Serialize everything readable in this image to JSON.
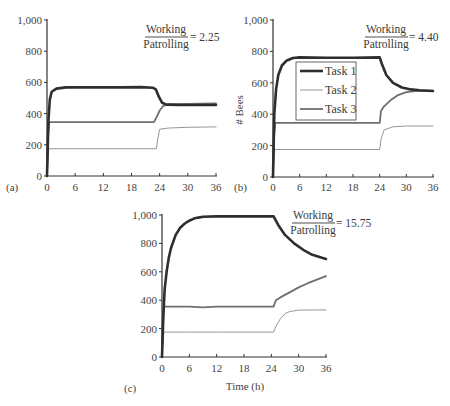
{
  "figure": {
    "panels": [
      {
        "id": "a",
        "label": "(a)",
        "ratio_num": "Working",
        "ratio_den": "Patrolling",
        "ratio_value": "= 2.25"
      },
      {
        "id": "b",
        "label": "(b)",
        "ratio_num": "Working",
        "ratio_den": "Patrolling",
        "ratio_value": "= 4.40"
      },
      {
        "id": "c",
        "label": "(c)",
        "ratio_num": "Working",
        "ratio_den": "Patrolling",
        "ratio_value": "= 15.75"
      }
    ],
    "legend": [
      "Task 1",
      "Task 2",
      "Task 3"
    ],
    "ylabel": "# Bees",
    "xlabel": "Time (h)"
  },
  "colors": {
    "task1": "#2e2e2e",
    "task2": "#8a8a8a",
    "task3": "#6f6f6f",
    "axis": "#333333"
  },
  "chart_data": [
    {
      "type": "line",
      "panel": "(a)",
      "title": "Working/Patrolling = 2.25",
      "xlabel": "",
      "ylabel": "",
      "xlim": [
        0,
        36
      ],
      "ylim": [
        0,
        1000
      ],
      "xticks": [
        0,
        6,
        12,
        18,
        24,
        30,
        36
      ],
      "yticks": [
        0,
        200,
        400,
        600,
        800,
        1000
      ],
      "ytick_labels": [
        "0",
        "200",
        "400",
        "600",
        "800",
        "1,000"
      ],
      "grid": false,
      "series": [
        {
          "name": "Task 1",
          "x": [
            0,
            0.3,
            0.6,
            1,
            2,
            4,
            8,
            12,
            16,
            20,
            22.5,
            23.2,
            23.8,
            24.5,
            25.5,
            28,
            32,
            36
          ],
          "y": [
            0,
            350,
            490,
            540,
            560,
            568,
            568,
            568,
            568,
            570,
            566,
            555,
            510,
            470,
            458,
            455,
            455,
            455
          ]
        },
        {
          "name": "Task 2",
          "x": [
            0,
            0.2,
            0.4,
            6,
            12,
            18,
            23.3,
            23.6,
            24,
            26,
            30,
            36
          ],
          "y": [
            0,
            100,
            175,
            175,
            175,
            175,
            175,
            240,
            300,
            308,
            312,
            315
          ]
        },
        {
          "name": "Task 3",
          "x": [
            0,
            0.2,
            0.5,
            6,
            12,
            18,
            22.8,
            23.4,
            24,
            24.8,
            26,
            30,
            36
          ],
          "y": [
            0,
            250,
            345,
            345,
            345,
            345,
            345,
            380,
            420,
            450,
            460,
            462,
            465
          ]
        }
      ]
    },
    {
      "type": "line",
      "panel": "(b)",
      "title": "Working/Patrolling = 4.40",
      "xlabel": "",
      "ylabel": "# Bees",
      "xlim": [
        0,
        36
      ],
      "ylim": [
        0,
        1000
      ],
      "xticks": [
        0,
        6,
        12,
        18,
        24,
        30,
        36
      ],
      "yticks": [
        0,
        200,
        400,
        600,
        800,
        1000
      ],
      "ytick_labels": [
        "0",
        "200",
        "400",
        "600",
        "800",
        "1,000"
      ],
      "legend_position": "inside-left",
      "grid": false,
      "series": [
        {
          "name": "Task 1",
          "x": [
            0,
            0.3,
            0.7,
            1.2,
            2,
            3,
            4.5,
            6,
            12,
            18,
            24,
            24.5,
            25.5,
            27,
            29,
            31,
            33,
            36
          ],
          "y": [
            0,
            400,
            560,
            650,
            710,
            740,
            758,
            762,
            760,
            760,
            762,
            720,
            650,
            600,
            570,
            558,
            553,
            548
          ]
        },
        {
          "name": "Task 2",
          "x": [
            0,
            0.2,
            0.4,
            6,
            12,
            18,
            24,
            24.3,
            25,
            27,
            30,
            36
          ],
          "y": [
            0,
            100,
            175,
            175,
            175,
            175,
            175,
            240,
            300,
            320,
            325,
            325
          ]
        },
        {
          "name": "Task 3",
          "x": [
            0,
            0.2,
            0.5,
            6,
            12,
            18,
            24,
            24.3,
            25,
            26.5,
            28,
            30,
            32,
            36
          ],
          "y": [
            0,
            250,
            345,
            345,
            345,
            345,
            345,
            420,
            450,
            490,
            520,
            540,
            548,
            550
          ]
        }
      ]
    },
    {
      "type": "line",
      "panel": "(c)",
      "title": "Working/Patrolling = 15.75",
      "xlabel": "Time (h)",
      "ylabel": "",
      "xlim": [
        0,
        36
      ],
      "ylim": [
        0,
        1000
      ],
      "xticks": [
        0,
        6,
        12,
        18,
        24,
        30,
        36
      ],
      "yticks": [
        0,
        200,
        400,
        600,
        800,
        1000
      ],
      "ytick_labels": [
        "0",
        "200",
        "400",
        "600",
        "800",
        "1,000"
      ],
      "grid": false,
      "series": [
        {
          "name": "Task 1",
          "x": [
            0,
            0.3,
            0.6,
            1,
            1.5,
            2,
            3,
            4,
            5,
            6,
            7,
            8,
            9,
            12,
            18,
            24.5,
            25.5,
            27,
            29,
            31,
            33,
            36
          ],
          "y": [
            0,
            300,
            480,
            600,
            700,
            770,
            860,
            910,
            940,
            960,
            975,
            982,
            988,
            990,
            990,
            990,
            930,
            860,
            800,
            755,
            720,
            690
          ]
        },
        {
          "name": "Task 2",
          "x": [
            0,
            0.2,
            0.4,
            6,
            12,
            18,
            24.5,
            25,
            26,
            27,
            28,
            30,
            36
          ],
          "y": [
            0,
            100,
            175,
            175,
            175,
            175,
            175,
            215,
            270,
            305,
            320,
            330,
            332
          ]
        },
        {
          "name": "Task 3",
          "x": [
            0,
            0.2,
            0.5,
            6,
            9,
            12,
            18,
            24.5,
            25,
            26,
            28,
            30,
            32,
            34,
            36
          ],
          "y": [
            0,
            250,
            355,
            355,
            350,
            355,
            355,
            355,
            400,
            420,
            455,
            490,
            520,
            545,
            570
          ]
        }
      ]
    }
  ]
}
